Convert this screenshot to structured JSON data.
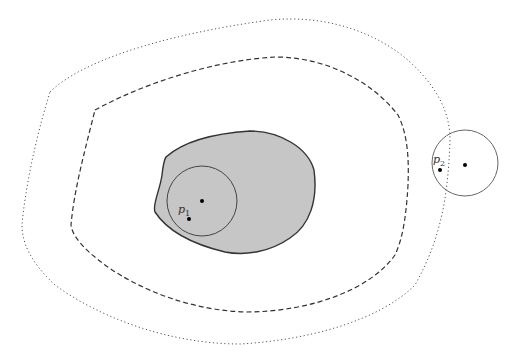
{
  "diagram": {
    "regions": [
      {
        "id": "outer-dotted",
        "style": "dotted"
      },
      {
        "id": "middle-dashed",
        "style": "dashed"
      },
      {
        "id": "inner-shaded",
        "style": "solid",
        "fill": "#c6c6c6"
      }
    ],
    "circles": [
      {
        "id": "circle-1",
        "center": [
          202,
          200
        ],
        "radius": 35
      },
      {
        "id": "circle-2",
        "center": [
          465,
          163
        ],
        "radius": 33
      }
    ],
    "points": [
      {
        "id": "p1",
        "label": "p",
        "subscript": "1"
      },
      {
        "id": "p2",
        "label": "p",
        "subscript": "2"
      }
    ]
  }
}
